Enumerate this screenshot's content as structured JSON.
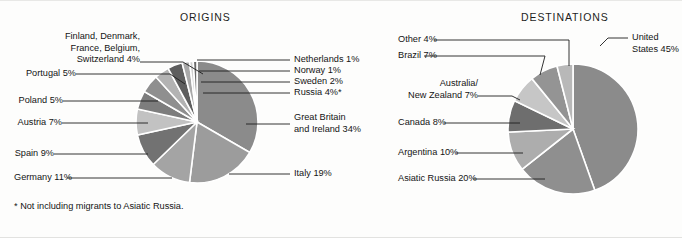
{
  "figure": {
    "background_color": "#fdfdfc",
    "footnote": "* Not including migrants to Asiatic Russia."
  },
  "origins": {
    "title": "ORIGINS",
    "labels": {
      "nordics_west": {
        "line1": "Finland, Denmark,",
        "line2": "France, Belgium,",
        "line3": "Switzerland  4%"
      },
      "portugal": "Portugal  5%",
      "poland": "Poland  5%",
      "austria": "Austria  7%",
      "spain": "Spain  9%",
      "germany": "Germany  11%",
      "netherlands": "Netherlands  1%",
      "norway": "Norway  1%",
      "sweden": "Sweden  2%",
      "russia": "Russia  4%*",
      "great_britain": {
        "line1": "Great Britain",
        "line2": "and Ireland  34%"
      },
      "italy": "Italy  19%"
    }
  },
  "destinations": {
    "title": "DESTINATIONS",
    "labels": {
      "other": "Other  4%",
      "brazil": "Brazil  7%",
      "australia_nz": {
        "line1": "Australia/",
        "line2": "New Zealand  7%"
      },
      "canada": "Canada  8%",
      "argentina": "Argentina  10%",
      "asiatic_russia": "Asiatic Russia  20%",
      "united_states": {
        "line1": "United",
        "line2": "States 45%"
      }
    }
  },
  "chart_data": [
    {
      "type": "pie",
      "title": "ORIGINS",
      "unit": "percent",
      "total": 100,
      "note": "* Not including migrants to Asiatic Russia.",
      "center": [
        197,
        121
      ],
      "radius": 61,
      "start_angle_deg": -90,
      "direction": "clockwise",
      "categories": [
        "Great Britain and Ireland",
        "Italy",
        "Germany",
        "Spain",
        "Austria",
        "Poland",
        "Portugal",
        "Finland, Denmark, France, Belgium, Switzerland",
        "Russia",
        "Sweden",
        "Norway",
        "Netherlands"
      ],
      "values": [
        34,
        19,
        11,
        9,
        7,
        5,
        5,
        4,
        4,
        2,
        1,
        1
      ],
      "colors": [
        "#8b8b8b",
        "#9c9c9c",
        "#a4a4a4",
        "#727272",
        "#c2c2c2",
        "#7d7d7d",
        "#8f8f8f",
        "#b3b3b3",
        "#5e5e5e",
        "#a9a9a9",
        "#cfcfcf",
        "#6a6a6a"
      ],
      "legend": "leader-line labels",
      "grid": false
    },
    {
      "type": "pie",
      "title": "DESTINATIONS",
      "unit": "percent",
      "total": 101,
      "center": [
        573,
        128
      ],
      "radius": 65,
      "start_angle_deg": -90,
      "direction": "clockwise",
      "categories": [
        "United States",
        "Asiatic Russia",
        "Argentina",
        "Canada",
        "Australia/New Zealand",
        "Brazil",
        "Other"
      ],
      "values": [
        45,
        20,
        10,
        8,
        7,
        7,
        4
      ],
      "colors": [
        "#8b8b8b",
        "#8f8f8f",
        "#adadad",
        "#6e6e6e",
        "#c6c6c6",
        "#949494",
        "#b8b8b8"
      ],
      "legend": "leader-line labels",
      "grid": false
    }
  ]
}
